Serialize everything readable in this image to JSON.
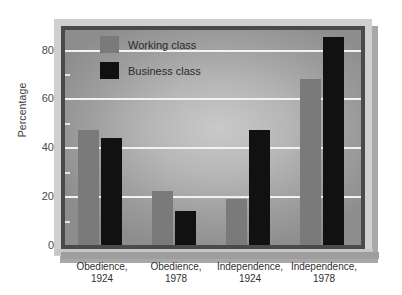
{
  "chart_data": {
    "type": "bar",
    "title": "",
    "subtitle": "",
    "xlabel": "",
    "ylabel": "Percentage",
    "ylim": [
      0,
      88
    ],
    "yticks": [
      0,
      20,
      40,
      60,
      80
    ],
    "ytick_labels": [
      "0",
      "20",
      "40",
      "60",
      "80"
    ],
    "yminor_ticks": [
      10,
      30,
      50,
      70
    ],
    "grid": "horizontal",
    "legend_position": "top-left-inside",
    "categories": [
      "Obedience, 1924",
      "Obedience, 1978",
      "Independence, 1924",
      "Independence, 1978"
    ],
    "category_lines": [
      [
        "Obedience,",
        "1924"
      ],
      [
        "Obedience,",
        "1978"
      ],
      [
        "Independence,",
        "1924"
      ],
      [
        "Independence,",
        "1978"
      ]
    ],
    "series": [
      {
        "name": "Working class",
        "color": "#7a7a7a",
        "values": [
          47,
          22,
          19,
          68
        ]
      },
      {
        "name": "Business class",
        "color": "#111111",
        "values": [
          44,
          14,
          47,
          85
        ]
      }
    ],
    "annotations": []
  },
  "legend": {
    "items": [
      {
        "label": "Working class",
        "swatch": "working"
      },
      {
        "label": "Business class",
        "swatch": "business"
      }
    ]
  },
  "colors": {
    "working_class": "#7a7a7a",
    "business_class": "#111111",
    "gridline": "#f2f2f2",
    "plot_background_center": "#c9c9c9",
    "plot_background_edge": "#8d8d8d",
    "frame_dark": "#4a4a4a",
    "frame_light": "#cfcfcf",
    "shadow": "#a8a8a8",
    "page_background": "#ffffff"
  }
}
